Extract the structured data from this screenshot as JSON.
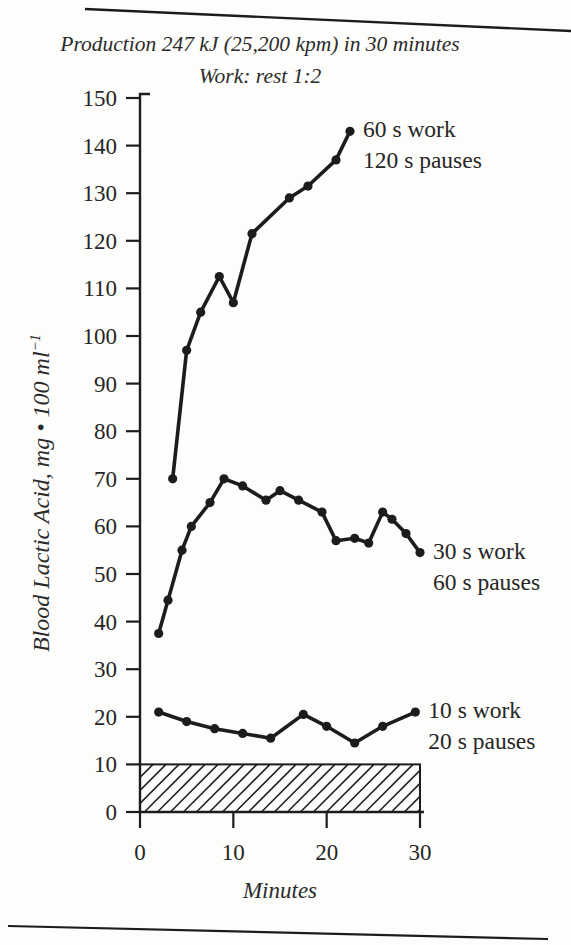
{
  "page": {
    "background": "#fdfdfb"
  },
  "chart_data": {
    "type": "line",
    "title": "Production 247 kJ (25,200 kpm) in 30 minutes",
    "subtitle": "Work: rest 1:2",
    "xlabel": "Minutes",
    "ylabel": "Blood Lactic Acid, mg • 100 ml⁻¹",
    "ylabel_parts": {
      "text": "Blood Lactic Acid, mg • 100 ml",
      "sup": "−1"
    },
    "xlim": [
      0,
      30
    ],
    "ylim": [
      0,
      150
    ],
    "xticks": [
      0,
      10,
      20,
      30
    ],
    "yticks": [
      0,
      10,
      20,
      30,
      40,
      50,
      60,
      70,
      80,
      90,
      100,
      110,
      120,
      130,
      140,
      150
    ],
    "grid": false,
    "legend_position": "labels-at-curve-ends",
    "ink_color": "#1c1c1c",
    "series": [
      {
        "name": "60 s work, 120 s pauses",
        "label_lines": [
          "60 s work",
          "120 s pauses"
        ],
        "x": [
          3.5,
          5,
          6.5,
          8.5,
          10,
          12,
          16,
          18,
          21,
          22.5
        ],
        "y": [
          70,
          97,
          105,
          112.5,
          107,
          121.5,
          129,
          131.5,
          137,
          143
        ]
      },
      {
        "name": "30 s work, 60 s pauses",
        "label_lines": [
          "30 s work",
          "60 s pauses"
        ],
        "x": [
          2,
          3,
          4.5,
          5.5,
          7.5,
          9,
          11,
          13.5,
          15,
          17,
          19.5,
          21,
          23,
          24.5,
          26,
          27,
          28.5,
          30
        ],
        "y": [
          37.5,
          44.5,
          55,
          60,
          65,
          70,
          68.5,
          65.5,
          67.5,
          65.5,
          63,
          57,
          57.5,
          56.5,
          63,
          61.5,
          58.5,
          54.5
        ]
      },
      {
        "name": "10 s work, 20 s pauses",
        "label_lines": [
          "10 s work",
          "20 s pauses"
        ],
        "x": [
          2,
          5,
          8,
          11,
          14,
          17.5,
          20,
          23,
          26,
          29.5
        ],
        "y": [
          21,
          19,
          17.5,
          16.5,
          15.5,
          20.5,
          18,
          14.5,
          18,
          21
        ]
      }
    ],
    "hatched_region": {
      "x_range": [
        0,
        30
      ],
      "y_range": [
        0,
        10
      ],
      "pattern": "diagonal-hatch"
    }
  }
}
